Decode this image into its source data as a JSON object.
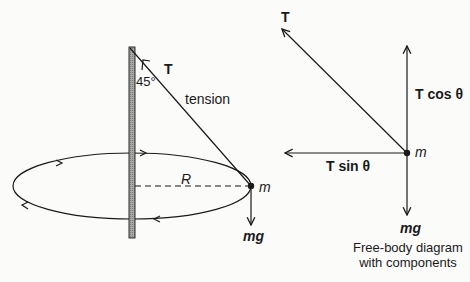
{
  "left_diagram": {
    "angle_label": "45°",
    "tension_vector_label": "T",
    "tension_word": "tension",
    "radius_label": "R",
    "mass_label": "m",
    "weight_label": "mg"
  },
  "right_diagram": {
    "tension_label": "T",
    "vertical_component_label": "T cos θ",
    "horizontal_component_label": "T sin θ",
    "mass_label": "m",
    "weight_label": "mg",
    "caption_line1": "Free-body diagram",
    "caption_line2": "with components"
  },
  "colors": {
    "ink": "#1a1a1a",
    "pole_fill": "#9a9a9a",
    "background": "#fbfbfa"
  }
}
